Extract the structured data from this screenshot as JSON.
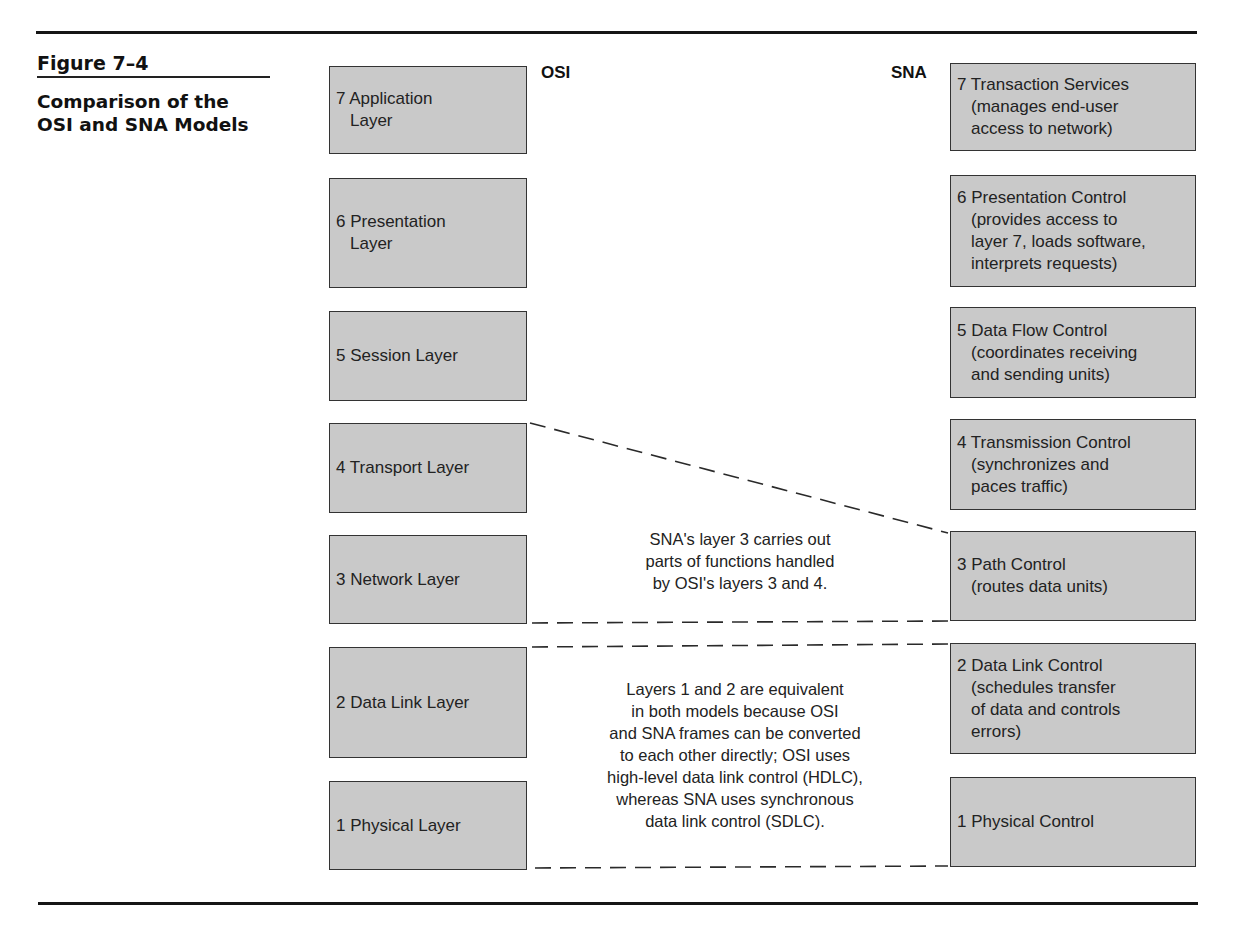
{
  "figure": {
    "number": "Figure 7–4",
    "title_line1": "Comparison of the",
    "title_line2": "OSI and SNA Models"
  },
  "models": {
    "left_label": "OSI",
    "right_label": "SNA"
  },
  "osi_layers": [
    {
      "line1": "7 Application",
      "rest": "Layer"
    },
    {
      "line1": "6 Presentation",
      "rest": "Layer"
    },
    {
      "line1": "5 Session Layer",
      "rest": ""
    },
    {
      "line1": "4 Transport Layer",
      "rest": ""
    },
    {
      "line1": "3 Network Layer",
      "rest": ""
    },
    {
      "line1": "2 Data Link Layer",
      "rest": ""
    },
    {
      "line1": "1 Physical Layer",
      "rest": ""
    }
  ],
  "sna_layers": [
    {
      "line1": "7 Transaction Services",
      "rest": "(manages end-user\naccess to network)"
    },
    {
      "line1": "6 Presentation Control",
      "rest": "(provides access to\nlayer 7, loads software,\ninterprets requests)"
    },
    {
      "line1": "5 Data Flow Control",
      "rest": "(coordinates receiving\nand sending units)"
    },
    {
      "line1": "4 Transmission Control",
      "rest": "(synchronizes and\npaces traffic)"
    },
    {
      "line1": "3 Path Control",
      "rest": "(routes data units)"
    },
    {
      "line1": "2 Data Link Control",
      "rest": "(schedules transfer\nof data and controls\nerrors)"
    },
    {
      "line1": "1 Physical Control",
      "rest": ""
    }
  ],
  "notes": {
    "layer3": "SNA's layer 3 carries out\nparts of functions handled\nby OSI's layers 3 and 4.",
    "layers12": "Layers 1 and 2 are equivalent\nin both models because OSI\nand SNA frames can be converted\nto each other directly; OSI uses\nhigh-level data link control (HDLC),\nwhereas SNA uses synchronous\ndata link control (SDLC)."
  },
  "colors": {
    "box_fill": "#c9c9c9",
    "box_border": "#333333",
    "rule": "#151515"
  }
}
